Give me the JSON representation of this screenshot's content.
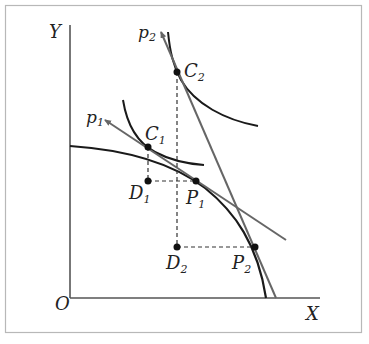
{
  "diagram": {
    "type": "production-possibility-frontier",
    "frame": {
      "x": 5,
      "y": 5,
      "width": 357,
      "height": 328,
      "stroke": "#b8b8b8"
    },
    "axes": {
      "origin_label": "O",
      "x_label": "X",
      "y_label": "Y",
      "color": "#555555"
    },
    "curve_color": "#1a1a1a",
    "price_line_color": "#666666",
    "dashed_color": "#333333",
    "labels": {
      "C1": {
        "main": "C",
        "sub": "1"
      },
      "C2": {
        "main": "C",
        "sub": "2"
      },
      "D1": {
        "main": "D",
        "sub": "1"
      },
      "D2": {
        "main": "D",
        "sub": "2"
      },
      "P1": {
        "main": "P",
        "sub": "1"
      },
      "P2": {
        "main": "P",
        "sub": "2"
      },
      "p1": {
        "main": "p",
        "sub": "1"
      },
      "p2": {
        "main": "p",
        "sub": "2"
      }
    },
    "points": {
      "C1": [
        148,
        147
      ],
      "C2": [
        177,
        72
      ],
      "D1": [
        148,
        181
      ],
      "D2": [
        177,
        247
      ],
      "P1": [
        196,
        181
      ],
      "P2": [
        255,
        247
      ]
    }
  }
}
